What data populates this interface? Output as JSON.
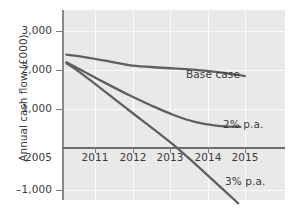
{
  "chart_data": {
    "type": "line",
    "title": "",
    "xlabel": "",
    "ylabel": "Annual cash flow (£000)",
    "xlim": [
      2010.5,
      2015.5
    ],
    "ylim": [
      -1000,
      3000
    ],
    "ytick_labels": [
      "3,000",
      "2,000",
      "1,000",
      "2005",
      "–1,000"
    ],
    "ytick_values": [
      3000,
      2000,
      1000,
      0,
      -1000
    ],
    "xtick_labels": [
      "2011",
      "2012",
      "2013",
      "2014",
      "2015"
    ],
    "xtick_values": [
      2011,
      2012,
      2013,
      2014,
      2015
    ],
    "origin_label": "2005",
    "grid": true,
    "legend_position": "inline-right",
    "line_color": "#5f5f5f",
    "plot_background": "#e9e9e9",
    "series": [
      {
        "name": "Base case",
        "label": "Base case",
        "x": [
          2010.6,
          2011,
          2011.5,
          2012,
          2012.5,
          2013,
          2013.5,
          2014,
          2014.6
        ],
        "values": [
          2060,
          2010,
          1930,
          1840,
          1800,
          1770,
          1740,
          1690,
          1610
        ]
      },
      {
        "name": "2% p.a.",
        "label": "2% p.a.",
        "x": [
          2010.6,
          2011,
          2011.5,
          2012,
          2012.5,
          2013,
          2013.5,
          2014,
          2014.5
        ],
        "values": [
          1900,
          1700,
          1450,
          1210,
          990,
          790,
          640,
          560,
          540
        ]
      },
      {
        "name": "3% p.a.",
        "label": "3% p.a.",
        "x": [
          2010.6,
          2011,
          2012,
          2013,
          2014,
          2014.45
        ],
        "values": [
          1880,
          1620,
          890,
          160,
          -680,
          -1070
        ]
      }
    ],
    "annotations": [
      {
        "text": "Base case",
        "x": 2013.3,
        "y": 1990
      },
      {
        "text": "2% p.a.",
        "x": 2014.15,
        "y": 820
      },
      {
        "text": "3% p.a.",
        "x": 2014.2,
        "y": -590
      }
    ]
  }
}
